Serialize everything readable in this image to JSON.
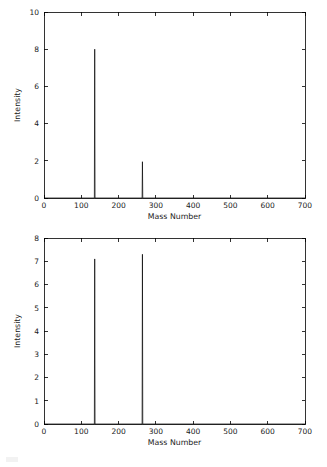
{
  "figure": {
    "background": "#ffffff",
    "line_color": "#000000"
  },
  "chart_data": [
    {
      "id": "top",
      "type": "line",
      "title": "",
      "xlabel": "Mass Number",
      "ylabel": "Intensity",
      "xlim": [
        0,
        700
      ],
      "ylim": [
        0,
        10
      ],
      "xticks": [
        0,
        100,
        200,
        300,
        400,
        500,
        600,
        700
      ],
      "yticks": [
        0,
        2,
        4,
        6,
        8,
        10
      ],
      "xticklabels": [
        "0",
        "100",
        "200",
        "300",
        "400",
        "500",
        "600",
        "700"
      ],
      "yticklabels": [
        "0",
        "2",
        "4",
        "6",
        "8",
        "10"
      ],
      "grid": false,
      "legend": null,
      "peaks": [
        {
          "mass": 136,
          "intensity": 8.0
        },
        {
          "mass": 264,
          "intensity": 1.95
        }
      ],
      "baseline": 0
    },
    {
      "id": "bottom",
      "type": "line",
      "title": "",
      "xlabel": "Mass Number",
      "ylabel": "Intensity",
      "xlim": [
        0,
        700
      ],
      "ylim": [
        0,
        8
      ],
      "xticks": [
        0,
        100,
        200,
        300,
        400,
        500,
        600,
        700
      ],
      "yticks": [
        0,
        1,
        2,
        3,
        4,
        5,
        6,
        7,
        8
      ],
      "xticklabels": [
        "0",
        "100",
        "200",
        "300",
        "400",
        "500",
        "600",
        "700"
      ],
      "yticklabels": [
        "0",
        "1",
        "2",
        "3",
        "4",
        "5",
        "6",
        "7",
        "8"
      ],
      "grid": false,
      "legend": null,
      "peaks": [
        {
          "mass": 136,
          "intensity": 7.1
        },
        {
          "mass": 264,
          "intensity": 7.3
        }
      ],
      "baseline": 0
    }
  ]
}
